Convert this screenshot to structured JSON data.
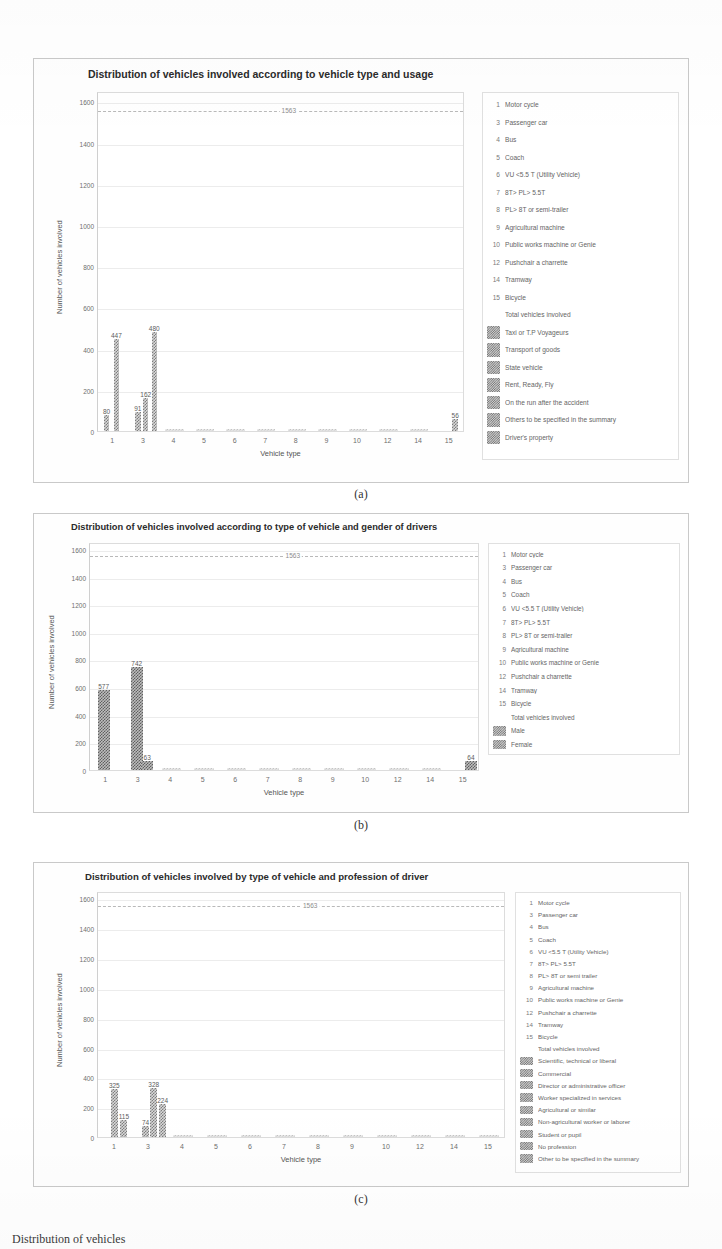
{
  "document": {
    "bottom_text": "Distribution of vehicles"
  },
  "figures": [
    {
      "caption": "(a)",
      "title": "Distribution of vehicles involved according to vehicle type and usage",
      "legend_items": [
        {
          "key": "1",
          "type": "key",
          "label": "Motor cycle"
        },
        {
          "key": "3",
          "type": "key",
          "label": "Passenger car"
        },
        {
          "key": "4",
          "type": "key",
          "label": "Bus"
        },
        {
          "key": "5",
          "type": "key",
          "label": "Coach"
        },
        {
          "key": "6",
          "type": "key",
          "label": "VU <5.5 T (Utility Vehicle)"
        },
        {
          "key": "7",
          "type": "key",
          "label": "8T> PL> 5.5T"
        },
        {
          "key": "8",
          "type": "key",
          "label": "PL> 8T or semi-trailer"
        },
        {
          "key": "9",
          "type": "key",
          "label": "Agricultural machine"
        },
        {
          "key": "10",
          "type": "key",
          "label": "Public works machine or Genie"
        },
        {
          "key": "12",
          "type": "key",
          "label": "Pushchair a charrette"
        },
        {
          "key": "14",
          "type": "key",
          "label": "Tramway"
        },
        {
          "key": "15",
          "type": "key",
          "label": "Bicycle"
        },
        {
          "key": "",
          "type": "dash",
          "label": "Total vehicles involved"
        },
        {
          "key": "",
          "type": "swatch",
          "label": "Taxi or T.P Voyageurs"
        },
        {
          "key": "",
          "type": "swatch",
          "label": "Transport of goods"
        },
        {
          "key": "",
          "type": "swatch",
          "label": "State vehicle"
        },
        {
          "key": "",
          "type": "swatch",
          "label": "Rent, Ready, Fly"
        },
        {
          "key": "",
          "type": "swatch",
          "label": "On the run after the accident"
        },
        {
          "key": "",
          "type": "swatch",
          "label": "Others to be specified in the summary"
        },
        {
          "key": "",
          "type": "swatch",
          "label": "Driver's property"
        }
      ],
      "chart_data": {
        "type": "bar",
        "title": "Distribution of vehicles involved according to vehicle type and usage",
        "xlabel": "Vehicle type",
        "ylabel": "Number of vehicles involved",
        "ylim": [
          0,
          1650
        ],
        "yticks": [
          0,
          200,
          400,
          600,
          800,
          1000,
          1200,
          1400,
          1600
        ],
        "ytick_labels": [
          "0",
          "200",
          "400",
          "600",
          "800",
          "1000",
          "1200",
          "1400",
          "1600"
        ],
        "categories": [
          "1",
          "3",
          "4",
          "5",
          "6",
          "7",
          "8",
          "9",
          "10",
          "12",
          "14",
          "15"
        ],
        "grid": true,
        "legend_position": "right-outside",
        "reference_line": {
          "value": 1563,
          "label": "1563",
          "style": "dashed",
          "name": "Total vehicles involved"
        },
        "points": [
          {
            "category": "1",
            "offset": -0.22,
            "value": 80,
            "label": "80"
          },
          {
            "category": "1",
            "offset": 0.1,
            "value": 447,
            "label": "447"
          },
          {
            "category": "3",
            "offset": -0.2,
            "value": 91,
            "label": "91"
          },
          {
            "category": "3",
            "offset": 0.06,
            "value": 162,
            "label": "162"
          },
          {
            "category": "3",
            "offset": 0.34,
            "value": 480,
            "label": "480"
          },
          {
            "category": "15",
            "offset": 0.18,
            "value": 56,
            "label": "56"
          }
        ]
      }
    },
    {
      "caption": "(b)",
      "title": "Distribution of vehicles involved according to type of vehicle and gender of drivers",
      "legend_items": [
        {
          "key": "1",
          "type": "key",
          "label": "Motor cycle"
        },
        {
          "key": "3",
          "type": "key",
          "label": "Passenger car"
        },
        {
          "key": "4",
          "type": "key",
          "label": "Bus"
        },
        {
          "key": "5",
          "type": "key",
          "label": "Coach"
        },
        {
          "key": "6",
          "type": "key",
          "label": "VU <5.5 T (Utility Vehicle)"
        },
        {
          "key": "7",
          "type": "key",
          "label": "8T> PL> 5.5T"
        },
        {
          "key": "8",
          "type": "key",
          "label": "PL> 8T or semi-trailer"
        },
        {
          "key": "9",
          "type": "key",
          "label": "Agricultural machine"
        },
        {
          "key": "10",
          "type": "key",
          "label": "Public works machine or Genie"
        },
        {
          "key": "12",
          "type": "key",
          "label": "Pushchair a charrette"
        },
        {
          "key": "14",
          "type": "key",
          "label": "Tramway"
        },
        {
          "key": "15",
          "type": "key",
          "label": "Bicycle"
        },
        {
          "key": "",
          "type": "dash",
          "label": "Total vehicles involved"
        },
        {
          "key": "",
          "type": "swatch",
          "label": "Male"
        },
        {
          "key": "",
          "type": "swatch",
          "label": "Female"
        }
      ],
      "chart_data": {
        "type": "bar",
        "title": "Distribution of vehicles involved according to type of vehicle and gender of drivers",
        "xlabel": "Vehicle type",
        "ylabel": "Number of vehicles involved",
        "ylim": [
          0,
          1650
        ],
        "yticks": [
          0,
          200,
          400,
          600,
          800,
          1000,
          1200,
          1400,
          1600
        ],
        "ytick_labels": [
          "0",
          "200",
          "400",
          "600",
          "800",
          "1000",
          "1200",
          "1400",
          "1600"
        ],
        "categories": [
          "1",
          "3",
          "4",
          "5",
          "6",
          "7",
          "8",
          "9",
          "10",
          "12",
          "14",
          "15"
        ],
        "grid": true,
        "legend_position": "right-outside",
        "reference_line": {
          "value": 1563,
          "label": "1563",
          "style": "dashed",
          "name": "Total vehicles involved"
        },
        "points": [
          {
            "category": "1",
            "offset": -0.08,
            "value": 577,
            "label": "577",
            "series": "Male"
          },
          {
            "category": "3",
            "offset": -0.06,
            "value": 742,
            "label": "742",
            "series": "Male"
          },
          {
            "category": "3",
            "offset": 0.26,
            "value": 63,
            "label": "63",
            "series": "Female"
          },
          {
            "category": "15",
            "offset": 0.22,
            "value": 64,
            "label": "64",
            "series": "Female"
          }
        ]
      }
    },
    {
      "caption": "(c)",
      "title": "Distribution of vehicles involved by type of vehicle and profession of driver",
      "legend_items": [
        {
          "key": "1",
          "type": "key",
          "label": "Motor cycle"
        },
        {
          "key": "3",
          "type": "key",
          "label": "Passenger car"
        },
        {
          "key": "4",
          "type": "key",
          "label": "Bus"
        },
        {
          "key": "5",
          "type": "key",
          "label": "Coach"
        },
        {
          "key": "6",
          "type": "key",
          "label": "VU <5.5 T (Utility Vehicle)"
        },
        {
          "key": "7",
          "type": "key",
          "label": "8T> PL> 5.5T"
        },
        {
          "key": "8",
          "type": "key",
          "label": "PL> 8T or semi trailer"
        },
        {
          "key": "9",
          "type": "key",
          "label": "Agricultural machine"
        },
        {
          "key": "10",
          "type": "key",
          "label": "Public works machine or Genie"
        },
        {
          "key": "12",
          "type": "key",
          "label": "Pushchair a charrette"
        },
        {
          "key": "14",
          "type": "key",
          "label": "Tramway"
        },
        {
          "key": "15",
          "type": "key",
          "label": "Bicycle"
        },
        {
          "key": "",
          "type": "dash",
          "label": "Total vehicles involved"
        },
        {
          "key": "",
          "type": "swatch",
          "label": "Scientific, technical or liberal"
        },
        {
          "key": "",
          "type": "swatch",
          "label": "Commercial"
        },
        {
          "key": "",
          "type": "swatch",
          "label": "Director or administrative officer"
        },
        {
          "key": "",
          "type": "swatch",
          "label": "Worker specialized in services"
        },
        {
          "key": "",
          "type": "swatch",
          "label": "Agricultural or similar"
        },
        {
          "key": "",
          "type": "swatch",
          "label": "Non-agricultural worker or laborer"
        },
        {
          "key": "",
          "type": "swatch",
          "label": "Student or pupil"
        },
        {
          "key": "",
          "type": "swatch",
          "label": "No profession"
        },
        {
          "key": "",
          "type": "swatch",
          "label": "Other to be specified in the summary"
        }
      ],
      "chart_data": {
        "type": "bar",
        "title": "Distribution of vehicles involved by type of vehicle and profession of driver",
        "xlabel": "Vehicle type",
        "ylabel": "Number of vehicles involved",
        "ylim": [
          0,
          1650
        ],
        "yticks": [
          0,
          200,
          400,
          600,
          800,
          1000,
          1200,
          1400,
          1600
        ],
        "ytick_labels": [
          "0",
          "200",
          "400",
          "600",
          "800",
          "1000",
          "1200",
          "1400",
          "1600"
        ],
        "categories": [
          "1",
          "3",
          "4",
          "5",
          "6",
          "7",
          "8",
          "9",
          "10",
          "12",
          "14",
          "15"
        ],
        "grid": true,
        "legend_position": "right-outside",
        "reference_line": {
          "value": 1563,
          "label": "1563",
          "style": "dashed",
          "name": "Total vehicles involved"
        },
        "points": [
          {
            "category": "1",
            "offset": -0.02,
            "value": 325,
            "label": "325"
          },
          {
            "category": "1",
            "offset": 0.26,
            "value": 115,
            "label": "115"
          },
          {
            "category": "3",
            "offset": -0.1,
            "value": 74,
            "label": "74"
          },
          {
            "category": "3",
            "offset": 0.14,
            "value": 328,
            "label": "328"
          },
          {
            "category": "3",
            "offset": 0.4,
            "value": 224,
            "label": "224"
          }
        ]
      }
    }
  ]
}
